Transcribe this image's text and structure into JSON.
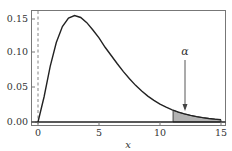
{
  "chart_data": {
    "type": "area",
    "title": "",
    "xlabel": "x",
    "ylabel": "",
    "xlim": [
      -1.2,
      15.3
    ],
    "ylim": [
      -0.006,
      0.16
    ],
    "grid": false,
    "legend": null,
    "x_ticks": [
      0,
      5,
      10,
      15
    ],
    "x_tick_labels": [
      "0",
      "5",
      "10",
      "15"
    ],
    "y_ticks": [
      0.0,
      0.05,
      0.1,
      0.15
    ],
    "y_tick_labels": [
      "0.00",
      "0.05",
      "0.10",
      "0.15"
    ],
    "series": [
      {
        "name": "density (chi-square, 5 df)",
        "x": [
          0,
          0.5,
          1,
          1.5,
          2,
          2.5,
          3,
          3.5,
          4,
          4.5,
          5,
          5.5,
          6,
          6.5,
          7,
          7.5,
          8,
          8.5,
          9,
          9.5,
          10,
          10.5,
          11,
          11.07,
          11.5,
          12,
          12.5,
          13,
          13.5,
          14,
          14.5,
          15
        ],
        "values": [
          0.0,
          0.0366,
          0.0807,
          0.1151,
          0.1384,
          0.1505,
          0.1542,
          0.1515,
          0.144,
          0.1334,
          0.122,
          0.1083,
          0.0964,
          0.0844,
          0.073,
          0.0626,
          0.0531,
          0.0448,
          0.0375,
          0.0313,
          0.0259,
          0.0214,
          0.0176,
          0.0171,
          0.0144,
          0.0118,
          0.0096,
          0.0078,
          0.0063,
          0.0051,
          0.0041,
          0.0033
        ]
      }
    ],
    "shaded_region": {
      "from": 11.07,
      "to": 15,
      "color": "#b3b3b3",
      "label": "α"
    },
    "reference_lines": [
      {
        "orientation": "vertical",
        "x": 0,
        "style": "dashed"
      },
      {
        "orientation": "horizontal",
        "y": 0,
        "style": "solid"
      }
    ],
    "annotations": [
      {
        "text": "α",
        "arrow_to": {
          "x": 12,
          "y": 0.017
        }
      }
    ]
  },
  "labels": {
    "x_axis": "x",
    "alpha": "α",
    "xticks": [
      "0",
      "5",
      "10",
      "15"
    ],
    "yticks": [
      "0.00",
      "0.05",
      "0.10",
      "0.15"
    ]
  },
  "colors": {
    "curve": "#222222",
    "shade": "#b3b3b3",
    "frame": "#555555",
    "dashed": "#666666"
  }
}
